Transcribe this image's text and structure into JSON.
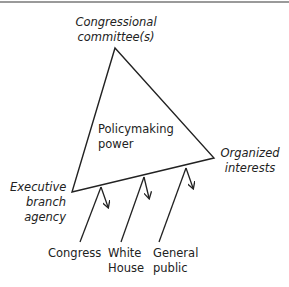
{
  "diagram": {
    "type": "iron-triangle",
    "center_label": {
      "line1": "Policymaking",
      "line2": "power"
    },
    "vertices": {
      "top": {
        "line1": "Congressional",
        "line2": "committee(s)"
      },
      "right": {
        "line1": "Organized",
        "line2": "interests"
      },
      "left": {
        "line1": "Executive",
        "line2": "branch",
        "line3": "agency"
      }
    },
    "external_influences": [
      {
        "line1": "Congress",
        "line2": ""
      },
      {
        "line1": "White",
        "line2": "House"
      },
      {
        "line1": "General",
        "line2": "public"
      }
    ],
    "colors": {
      "line": "#222222",
      "text": "#222222",
      "border": "#9a9a9a"
    }
  }
}
